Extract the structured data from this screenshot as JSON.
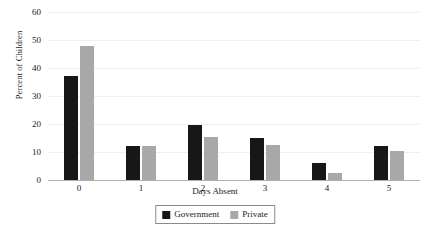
{
  "chart_data": {
    "type": "bar",
    "title": "",
    "subtitle": "",
    "xlabel": "Days Absent",
    "ylabel": "Percent of Children",
    "categories": [
      "0",
      "1",
      "2",
      "3",
      "4",
      "5"
    ],
    "series": [
      {
        "name": "Government",
        "color": "#171717",
        "values": [
          37,
          12,
          19.5,
          15,
          6,
          12
        ]
      },
      {
        "name": "Private",
        "color": "#a8a8a8",
        "values": [
          48,
          12,
          15.5,
          12.5,
          2.5,
          10.5
        ]
      }
    ],
    "ylim": [
      0,
      60
    ],
    "ytick_labels": [
      "0",
      "10",
      "20",
      "30",
      "40",
      "50",
      "60"
    ],
    "ytick_values": [
      0,
      10,
      20,
      30,
      40,
      50,
      60
    ],
    "grid": true,
    "grid_color": "#f0f0f0",
    "legend_position": "bottom-center",
    "axis_color": "#b0b0b0",
    "background_color": "#ffffff"
  },
  "legend": {
    "items": [
      {
        "label": "Government"
      },
      {
        "label": "Private"
      }
    ]
  },
  "axes": {
    "x_title": "Days Absent",
    "y_title": "Percent of Children"
  }
}
